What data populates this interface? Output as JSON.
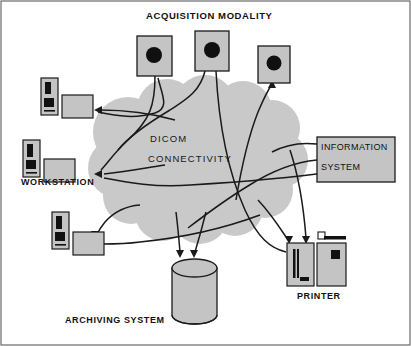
{
  "diagram": {
    "cloud": {
      "line1": "DICOM",
      "line2": "CONNECTIVITY",
      "fill": "#c9c9c9"
    },
    "labels": {
      "acquisition_modality": "ACQUISITION MODALITY",
      "workstation": "WORKSTATION",
      "information_system": {
        "line1": "INFORMATION",
        "line2": "SYSTEM"
      },
      "printer": "PRINTER",
      "archiving_system": "ARCHIVING SYSTEM"
    },
    "colors": {
      "device_fill": "#c4c4c4",
      "device_stroke": "#1b1b1b",
      "accent_dark": "#121212",
      "background": "#ffffff",
      "border": "#555555"
    },
    "nodes": [
      {
        "name": "acquisition-modality-1",
        "type": "modality",
        "label": "ACQUISITION MODALITY"
      },
      {
        "name": "acquisition-modality-2",
        "type": "modality",
        "label": "ACQUISITION MODALITY"
      },
      {
        "name": "acquisition-modality-3",
        "type": "modality",
        "label": "ACQUISITION MODALITY"
      },
      {
        "name": "workstation-top",
        "type": "workstation",
        "label": ""
      },
      {
        "name": "workstation-middle",
        "type": "workstation",
        "label": "WORKSTATION"
      },
      {
        "name": "workstation-bottom",
        "type": "workstation",
        "label": ""
      },
      {
        "name": "information-system",
        "type": "system",
        "label": "INFORMATION SYSTEM"
      },
      {
        "name": "printer",
        "type": "printer",
        "label": "PRINTER"
      },
      {
        "name": "archiving-system",
        "type": "storage",
        "label": "ARCHIVING SYSTEM"
      }
    ]
  }
}
